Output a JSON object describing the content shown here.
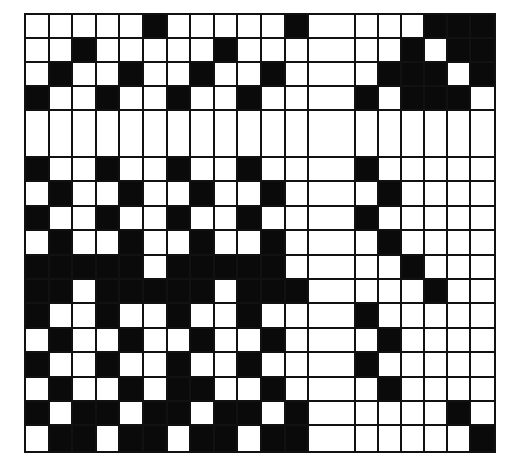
{
  "diagram": {
    "type": "weave-draft-grid",
    "colors": {
      "filled": "#0a0a0a",
      "empty": "#ffffff",
      "line": "#111111"
    },
    "layout": {
      "left_columns": 12,
      "gap_columns": 1,
      "right_columns": 6,
      "top_rows": 4,
      "gap_rows": 1,
      "bottom_rows": 12
    },
    "grid": [
      "000001000001 0 000111",
      "001000001000 0 001011",
      "010010010010 0 011101",
      "100100100100 0 101110",
      "000000000000 0 000000",
      "100100100100 0 100000",
      "010010010010 0 010000",
      "100100100100 0 100000",
      "010010010010 0 010000",
      "111110111110 0 001000",
      "110111110111 0 000100",
      "100100100100 0 100000",
      "010010010010 0 010000",
      "100100100100 0 100000",
      "010010110010 0 010000",
      "101101101101 0 000010",
      "011011011011 0 000001"
    ]
  }
}
